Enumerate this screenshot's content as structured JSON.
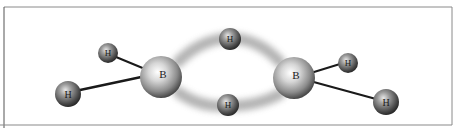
{
  "atoms": [
    {
      "id": "B1",
      "label": "B",
      "element": "boron",
      "x": 161,
      "y": 77,
      "r": 21,
      "font": 11
    },
    {
      "id": "B2",
      "label": "B",
      "element": "boron",
      "x": 294,
      "y": 78,
      "r": 21,
      "font": 11
    },
    {
      "id": "H1",
      "label": "H",
      "element": "hydrogen",
      "role": "terminal",
      "x": 108,
      "y": 53,
      "r": 10,
      "font": 9
    },
    {
      "id": "H2",
      "label": "H",
      "element": "hydrogen",
      "role": "terminal",
      "x": 68,
      "y": 94,
      "r": 13,
      "font": 10
    },
    {
      "id": "H3",
      "label": "H",
      "element": "hydrogen",
      "role": "bridging",
      "x": 230,
      "y": 39,
      "r": 11,
      "font": 9
    },
    {
      "id": "H4",
      "label": "H",
      "element": "hydrogen",
      "role": "bridging",
      "x": 228,
      "y": 105,
      "r": 11,
      "font": 9
    },
    {
      "id": "H5",
      "label": "H",
      "element": "hydrogen",
      "role": "terminal",
      "x": 348,
      "y": 63,
      "r": 10,
      "font": 9
    },
    {
      "id": "H6",
      "label": "H",
      "element": "hydrogen",
      "role": "terminal",
      "x": 386,
      "y": 102,
      "r": 13,
      "font": 10
    }
  ],
  "bonds": [
    {
      "from": "B1",
      "to": "H1",
      "type": "single"
    },
    {
      "from": "B1",
      "to": "H2",
      "type": "single"
    },
    {
      "from": "B2",
      "to": "H5",
      "type": "single"
    },
    {
      "from": "B2",
      "to": "H6",
      "type": "single"
    },
    {
      "from": "B1",
      "to": "H3",
      "type": "three-center"
    },
    {
      "from": "H3",
      "to": "B2",
      "type": "three-center"
    },
    {
      "from": "B1",
      "to": "H4",
      "type": "three-center"
    },
    {
      "from": "H4",
      "to": "B2",
      "type": "three-center"
    }
  ],
  "colors": {
    "frame": "#8a8a8a",
    "bond": "#1a1a1a",
    "cloud": "#9a9a9a",
    "sphere_light": "#ffffff",
    "sphere_mid": "#a8a8a8",
    "sphere_dark": "#3a3a3a"
  }
}
